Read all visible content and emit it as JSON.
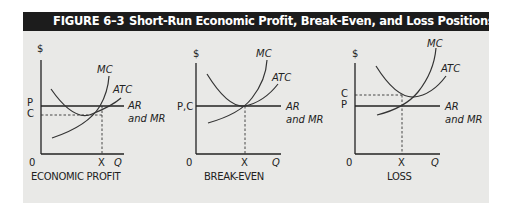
{
  "figure": {
    "number": "FIGURE 6–3",
    "title": "Short-Run Economic Profit, Break-Even, and Loss Positions",
    "header_bg": "#1c1c1c",
    "panel_bg": "#e9e9e7"
  },
  "panels": [
    {
      "caption": "ECONOMIC PROFIT",
      "y_axis_label": "$",
      "x_axis_label": "Q",
      "origin_label": "0",
      "x_mark_label": "X",
      "price_label": "P",
      "cost_label": "C",
      "mc_label": "MC",
      "atc_label": "ATC",
      "ar_label": "AR",
      "mr_label": "and MR",
      "relation": "P > C"
    },
    {
      "caption": "BREAK-EVEN",
      "y_axis_label": "$",
      "x_axis_label": "Q",
      "origin_label": "0",
      "x_mark_label": "X",
      "price_cost_label": "P,C",
      "mc_label": "MC",
      "atc_label": "ATC",
      "ar_label": "AR",
      "mr_label": "and MR",
      "relation": "P = C"
    },
    {
      "caption": "LOSS",
      "y_axis_label": "$",
      "x_axis_label": "Q",
      "origin_label": "0",
      "x_mark_label": "X",
      "price_label": "P",
      "cost_label": "C",
      "mc_label": "MC",
      "atc_label": "ATC",
      "ar_label": "AR",
      "mr_label": "and MR",
      "relation": "P < C"
    }
  ]
}
